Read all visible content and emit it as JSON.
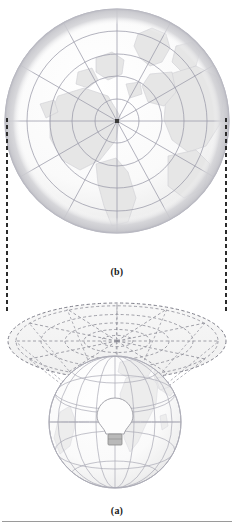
{
  "figure": {
    "captions": {
      "top_panel": "(b)",
      "bottom_panel": "(a)"
    },
    "panel_b": {
      "name": "polar-azimuthal-map-view",
      "description": "Resulting azimuthal map: circular flat map centered on the North Pole",
      "projection_center": "North Pole",
      "outline_shape": "circle",
      "graticule": {
        "meridians": 12,
        "parallels": 5,
        "grid_visible": "true"
      },
      "geometry": {
        "center_x": 117,
        "center_y": 121,
        "radius": 113
      },
      "colors": {
        "land_fill": "#e3e3e3",
        "ocean_fill": "#fbfbfb",
        "graticule_line": "#9a9aa8",
        "outline": "#b9b9c2",
        "pole_marker": "#3a3a3a"
      }
    },
    "panel_a": {
      "name": "gnomonic-projection-construction",
      "description": "Light source inside a transparent globe projects the graticule onto a tangent plane at the North Pole",
      "globe": {
        "name": "transparent-globe",
        "center_x": 115,
        "center_y": 422,
        "radius": 67,
        "graticule": {
          "meridians": 12,
          "parallels": 5,
          "grid_visible": "true"
        }
      },
      "light_source": {
        "name": "light-bulb",
        "label": "light source at globe center",
        "x": 115,
        "y": 426
      },
      "projection_plane": {
        "name": "tangent-plane",
        "shape": "ellipse",
        "center_x": 117,
        "center_y": 341,
        "radius_x": 109,
        "radius_y": 38,
        "line_style": "dashed"
      },
      "colors": {
        "globe_fill": "#f4f4f4",
        "globe_line": "#a9a9b4",
        "land_fill": "#ececec",
        "plane_fill": "#f2f2f2",
        "plane_line": "#8a8a94",
        "bulb_fill": "#fdfdfd",
        "bulb_base": "#9e9e9e"
      }
    },
    "connectors": {
      "name": "projection-correspondence-lines",
      "style": "dashed",
      "color": "#2b2b2b",
      "count": 2,
      "left_x": 7,
      "right_x": 226,
      "top_y": 118,
      "bottom_y": 314
    },
    "rule": {
      "name": "footer-rule",
      "color": "#9a9a9a"
    }
  }
}
